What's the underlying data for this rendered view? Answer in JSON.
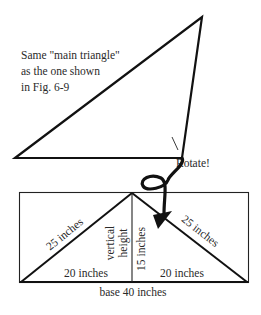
{
  "figure": {
    "caption_lines": [
      "Same \"main triangle\"",
      "as the one shown",
      "in Fig. 6-9"
    ],
    "rotate_label": "Rotate!",
    "labels": {
      "left_hypotenuse": "25 inches",
      "right_hypotenuse": "25 inches",
      "left_base": "20 inches",
      "right_base": "20 inches",
      "vertical_height_line1": "vertical",
      "vertical_height_line2": "height",
      "height_value": "15 inches",
      "total_base": "base 40 inches"
    },
    "colors": {
      "stroke": "#111111",
      "text": "#2a2a2a",
      "background": "#ffffff"
    }
  }
}
